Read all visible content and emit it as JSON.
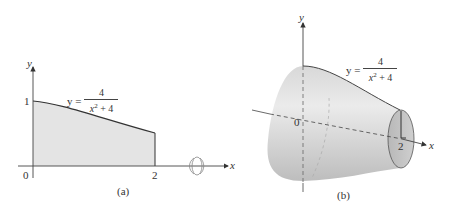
{
  "panel_a": {
    "caption": "(a)",
    "y_axis_label": "y",
    "x_axis_label": "x",
    "origin_label": "0",
    "y_tick_label": "1",
    "x_tick_label": "2",
    "equation": {
      "lhs": "y =",
      "numerator": "4",
      "denominator_base": "x",
      "denominator_exp": "2",
      "denominator_rest": " + 4"
    },
    "rotation_icon": "rotation-about-x-axis-icon",
    "region_fill": "#e4e4e4"
  },
  "panel_b": {
    "caption": "(b)",
    "y_axis_label": "y",
    "x_axis_label": "x",
    "origin_label": "0",
    "x_tick_label": "2",
    "equation": {
      "lhs": "y =",
      "numerator": "4",
      "denominator_base": "x",
      "denominator_exp": "2",
      "denominator_rest": " + 4"
    },
    "solid_fill": "#c8c8c8"
  }
}
